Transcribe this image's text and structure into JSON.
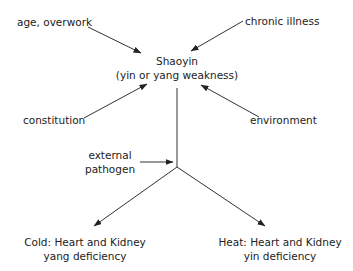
{
  "diagram": {
    "center_node": {
      "line1": "Shaoyin",
      "line2": "(yin or yang weakness)"
    },
    "causes": {
      "age_overwork": "age, overwork",
      "chronic_illness": "chronic illness",
      "constitution": "constitution",
      "environment": "environment",
      "external_pathogen_line1": "external",
      "external_pathogen_line2": "pathogen"
    },
    "outcomes": {
      "cold": {
        "line1": "Cold: Heart and Kidney",
        "line2": "yang deficiency"
      },
      "heat": {
        "line1": "Heat: Heart and Kidney",
        "line2": "yin deficiency"
      }
    },
    "colors": {
      "line": "#333333",
      "text": "#222222",
      "background": "#ffffff"
    }
  }
}
